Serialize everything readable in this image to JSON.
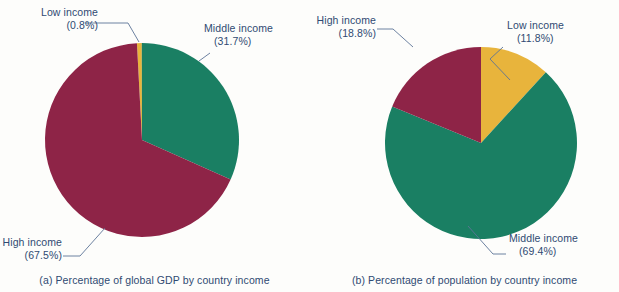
{
  "figure": {
    "background_color": "#fdfdfb",
    "text_color": "#2f4a72"
  },
  "palette": {
    "low_income": "#e8b43c",
    "middle_income": "#1a7f63",
    "high_income": "#8e2447",
    "leader_line": "#5c7496"
  },
  "panels": [
    {
      "id": "a",
      "caption": "(a) Percentage of global GDP by country income",
      "labels": {
        "low": {
          "name": "Low income",
          "value": "(0.8%)"
        },
        "middle": {
          "name": "Middle income",
          "value": "(31.7%)"
        },
        "high": {
          "name": "High income",
          "value": "(67.5%)"
        }
      }
    },
    {
      "id": "b",
      "caption": "(b) Percentage of population by country income",
      "labels": {
        "high": {
          "name": "High income",
          "value": "(18.8%)"
        },
        "low": {
          "name": "Low income",
          "value": "(11.8%)"
        },
        "middle": {
          "name": "Middle income",
          "value": "(69.4%)"
        }
      }
    }
  ],
  "chart_data": [
    {
      "type": "pie",
      "title": "(a) Percentage of global GDP by country income",
      "categories": [
        "Low income",
        "Middle income",
        "High income"
      ],
      "values": [
        0.8,
        31.7,
        67.5
      ],
      "value_labels": [
        "(0.8%)",
        "(31.7%)",
        "(67.5%)"
      ],
      "colors": [
        "#e8b43c",
        "#1a7f63",
        "#8e2447"
      ],
      "units": "percent",
      "start_angle_deg": -3,
      "direction": "clockwise",
      "legend": "callout labels with leader lines",
      "grid": false
    },
    {
      "type": "pie",
      "title": "(b) Percentage of population by country income",
      "categories": [
        "Low income",
        "Middle income",
        "High income"
      ],
      "values": [
        11.8,
        69.4,
        18.8
      ],
      "value_labels": [
        "(11.8%)",
        "(69.4%)",
        "(18.8%)"
      ],
      "colors": [
        "#e8b43c",
        "#1a7f63",
        "#8e2447"
      ],
      "units": "percent",
      "start_angle_deg": 0,
      "direction": "clockwise",
      "legend": "callout labels with leader lines",
      "grid": false
    }
  ]
}
